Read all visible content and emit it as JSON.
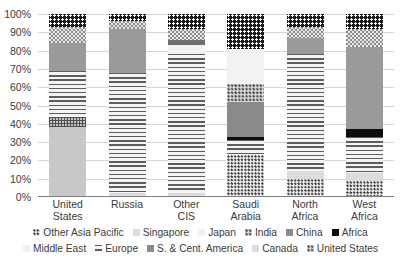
{
  "chart_data": {
    "type": "bar",
    "subtype": "stacked-100-percent",
    "title": "",
    "xlabel": "",
    "ylabel": "",
    "ylim": [
      0,
      100
    ],
    "ytick_labels": [
      "100%",
      "90%",
      "80%",
      "70%",
      "60%",
      "50%",
      "40%",
      "30%",
      "20%",
      "10%",
      "0%"
    ],
    "ytick_values": [
      100,
      90,
      80,
      70,
      60,
      50,
      40,
      30,
      20,
      10,
      0
    ],
    "grid": true,
    "legend_position": "bottom",
    "categories": [
      "United States",
      "Russia",
      "Other CIS",
      "Saudi Arabia",
      "North Africa",
      "West Africa"
    ],
    "series": [
      {
        "name": "Other Asia Pacific",
        "values": [
          0,
          0,
          0,
          23,
          10,
          9
        ]
      },
      {
        "name": "Singapore",
        "values": [
          0,
          2,
          2,
          0,
          4,
          4
        ]
      },
      {
        "name": "Japan",
        "values": [
          0,
          0,
          0,
          0,
          0,
          0
        ]
      },
      {
        "name": "India",
        "values": [
          0,
          0,
          0,
          8,
          0,
          0
        ]
      },
      {
        "name": "China",
        "values": [
          0,
          0,
          0,
          0,
          0,
          0
        ]
      },
      {
        "name": "Africa",
        "values": [
          7,
          4,
          8,
          19,
          7,
          8
        ]
      },
      {
        "name": "Middle East",
        "values": [
          0,
          0,
          5,
          19,
          0,
          0
        ]
      },
      {
        "name": "Europe",
        "values": [
          15,
          24,
          3,
          0,
          9,
          45
        ]
      },
      {
        "name": "S. & Cent. America",
        "values": [
          21,
          66,
          78,
          10,
          64,
          20
        ]
      },
      {
        "name": "Canada",
        "values": [
          9,
          4,
          6,
          10,
          6,
          10
        ]
      },
      {
        "name": "United States",
        "values": [
          48,
          0,
          0,
          11,
          0,
          4
        ]
      }
    ]
  },
  "axis": {
    "ticks": [
      {
        "label": "100%",
        "value": 100
      },
      {
        "label": "90%",
        "value": 90
      },
      {
        "label": "80%",
        "value": 80
      },
      {
        "label": "70%",
        "value": 70
      },
      {
        "label": "60%",
        "value": 60
      },
      {
        "label": "50%",
        "value": 50
      },
      {
        "label": "40%",
        "value": 40
      },
      {
        "label": "30%",
        "value": 30
      },
      {
        "label": "20%",
        "value": 20
      },
      {
        "label": "10%",
        "value": 10
      },
      {
        "label": "0%",
        "value": 0
      }
    ]
  },
  "categories": [
    {
      "line1": "United",
      "line2": "States"
    },
    {
      "line1": "Russia",
      "line2": ""
    },
    {
      "line1": "Other",
      "line2": "CIS"
    },
    {
      "line1": "Saudi",
      "line2": "Arabia"
    },
    {
      "line1": "North",
      "line2": "Africa"
    },
    {
      "line1": "West",
      "line2": "Africa"
    }
  ],
  "legend": {
    "row1": [
      {
        "label": "Other Asia Pacific",
        "swatch": "oap-swatch"
      },
      {
        "label": "Singapore",
        "swatch": "singapore-swatch"
      },
      {
        "label": "Japan",
        "swatch": "japan-swatch"
      },
      {
        "label": "India",
        "swatch": "india-swatch"
      },
      {
        "label": "China",
        "swatch": "china-swatch"
      },
      {
        "label": "Africa",
        "swatch": "africa-swatch"
      }
    ],
    "row2": [
      {
        "label": "Middle East",
        "swatch": "middleeast-swatch"
      },
      {
        "label": "Europe",
        "swatch": "europe-swatch"
      },
      {
        "label": "S. & Cent. America",
        "swatch": "scamerica-swatch"
      },
      {
        "label": "Canada",
        "swatch": "canada-swatch"
      },
      {
        "label": "United States",
        "swatch": "us-swatch"
      }
    ]
  },
  "bars": [
    {
      "name": "United States",
      "segments": [
        {
          "series": "United States",
          "from": 0,
          "to": 38,
          "pattern": "p-us"
        },
        {
          "series": "Canada",
          "from": 38,
          "to": 44,
          "pattern": "p-us-hatch"
        },
        {
          "series": "S. & Cent. America",
          "from": 44,
          "to": 69,
          "pattern": "p-scamerica"
        },
        {
          "series": "Europe",
          "from": 69,
          "to": 84,
          "pattern": "p-europe"
        },
        {
          "series": "Canada",
          "from": 84,
          "to": 93,
          "pattern": "p-canada"
        },
        {
          "series": "Africa",
          "from": 93,
          "to": 100,
          "pattern": "p-africa"
        }
      ]
    },
    {
      "name": "Russia",
      "segments": [
        {
          "series": "Singapore",
          "from": 0,
          "to": 2,
          "pattern": "p-singapore"
        },
        {
          "series": "S. & Cent. America",
          "from": 2,
          "to": 68,
          "pattern": "p-scamerica"
        },
        {
          "series": "Europe",
          "from": 68,
          "to": 92,
          "pattern": "p-europe"
        },
        {
          "series": "Canada",
          "from": 92,
          "to": 96,
          "pattern": "p-canada"
        },
        {
          "series": "Africa",
          "from": 96,
          "to": 100,
          "pattern": "p-africa"
        }
      ]
    },
    {
      "name": "Other CIS",
      "segments": [
        {
          "series": "Singapore",
          "from": 0,
          "to": 2,
          "pattern": "p-singapore"
        },
        {
          "series": "S. & Cent. America",
          "from": 2,
          "to": 78,
          "pattern": "p-scamerica"
        },
        {
          "series": "Middle East",
          "from": 78,
          "to": 83,
          "pattern": "p-middleeast"
        },
        {
          "series": "Europe",
          "from": 83,
          "to": 86,
          "pattern": "p-europe-dark"
        },
        {
          "series": "Canada",
          "from": 86,
          "to": 92,
          "pattern": "p-canada"
        },
        {
          "series": "Africa",
          "from": 92,
          "to": 100,
          "pattern": "p-africa"
        }
      ]
    },
    {
      "name": "Saudi Arabia",
      "segments": [
        {
          "series": "Other Asia Pacific",
          "from": 0,
          "to": 23,
          "pattern": "p-oap"
        },
        {
          "series": "S. & Cent. America",
          "from": 23,
          "to": 31,
          "pattern": "p-scamerica"
        },
        {
          "series": "China",
          "from": 31,
          "to": 33,
          "pattern": "p-black"
        },
        {
          "series": "Europe",
          "from": 33,
          "to": 52,
          "pattern": "p-china"
        },
        {
          "series": "India",
          "from": 52,
          "to": 62,
          "pattern": "p-india"
        },
        {
          "series": "Middle East",
          "from": 62,
          "to": 81,
          "pattern": "p-middleeast"
        },
        {
          "series": "Africa",
          "from": 81,
          "to": 100,
          "pattern": "p-africa"
        }
      ]
    },
    {
      "name": "North Africa",
      "segments": [
        {
          "series": "Other Asia Pacific",
          "from": 0,
          "to": 10,
          "pattern": "p-oap"
        },
        {
          "series": "Singapore",
          "from": 10,
          "to": 14,
          "pattern": "p-singapore"
        },
        {
          "series": "S. & Cent. America",
          "from": 14,
          "to": 78,
          "pattern": "p-scamerica"
        },
        {
          "series": "Europe",
          "from": 78,
          "to": 87,
          "pattern": "p-europe"
        },
        {
          "series": "Canada",
          "from": 87,
          "to": 93,
          "pattern": "p-canada"
        },
        {
          "series": "Africa",
          "from": 93,
          "to": 100,
          "pattern": "p-africa"
        }
      ]
    },
    {
      "name": "West Africa",
      "segments": [
        {
          "series": "Other Asia Pacific",
          "from": 0,
          "to": 9,
          "pattern": "p-oap"
        },
        {
          "series": "Singapore",
          "from": 9,
          "to": 13,
          "pattern": "p-singapore"
        },
        {
          "series": "S. & Cent. America",
          "from": 13,
          "to": 33,
          "pattern": "p-scamerica"
        },
        {
          "series": "China",
          "from": 33,
          "to": 37,
          "pattern": "p-black"
        },
        {
          "series": "Europe",
          "from": 37,
          "to": 82,
          "pattern": "p-europe"
        },
        {
          "series": "Canada",
          "from": 82,
          "to": 92,
          "pattern": "p-canada"
        },
        {
          "series": "Africa",
          "from": 92,
          "to": 100,
          "pattern": "p-africa"
        }
      ]
    }
  ]
}
